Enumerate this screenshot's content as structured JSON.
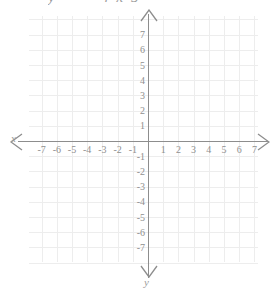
{
  "title_fragment": {
    "text": "y = —  4  x  5",
    "note": "cropped equation above plot"
  },
  "axes": {
    "x_label": "x",
    "y_label": "y",
    "x_min": -7,
    "x_max": 7,
    "y_min": -7,
    "y_max": 7
  },
  "ticks": {
    "x": [
      "-7",
      "-6",
      "-5",
      "-4",
      "-3",
      "-2",
      "-1",
      "1",
      "2",
      "3",
      "4",
      "5",
      "6",
      "7"
    ],
    "y": [
      "7",
      "6",
      "5",
      "4",
      "3",
      "2",
      "1",
      "-1",
      "-2",
      "-3",
      "-4",
      "-5",
      "-6",
      "-7"
    ]
  },
  "chart_data": {
    "type": "line",
    "title": "y = —  4  x  5",
    "xlabel": "x",
    "ylabel": "y",
    "xlim": [
      -7,
      7
    ],
    "ylim": [
      -7,
      7
    ],
    "xticks": [
      -7,
      -6,
      -5,
      -4,
      -3,
      -2,
      -1,
      1,
      2,
      3,
      4,
      5,
      6,
      7
    ],
    "yticks": [
      7,
      6,
      5,
      4,
      3,
      2,
      1,
      -1,
      -2,
      -3,
      -4,
      -5,
      -6,
      -7
    ],
    "grid": true,
    "legend": null,
    "series": [],
    "annotations": []
  },
  "colors": {
    "background": "#ffffff",
    "gridline": "#ededed",
    "axis": "#8d8d8d",
    "tick_label": "#8f8f8f",
    "axis_label": "#9d9d9d"
  }
}
